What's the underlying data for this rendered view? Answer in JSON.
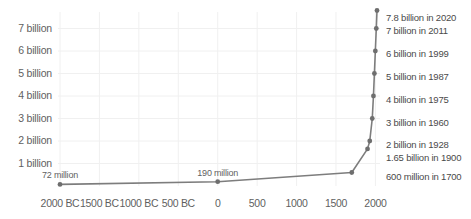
{
  "chart_data": {
    "type": "line",
    "title": "",
    "subtitle": "",
    "xlabel": "",
    "ylabel": "",
    "xlim": [
      -2000,
      2020
    ],
    "ylim": [
      0,
      7800000000
    ],
    "grid": true,
    "legend_position": "none",
    "x_ticks": [
      {
        "value": -2000,
        "label": "2000 BC"
      },
      {
        "value": -1500,
        "label": "1500 BC"
      },
      {
        "value": -1000,
        "label": "1000 BC"
      },
      {
        "value": -500,
        "label": "500 BC"
      },
      {
        "value": 0,
        "label": "0"
      },
      {
        "value": 500,
        "label": "500"
      },
      {
        "value": 1000,
        "label": "1000"
      },
      {
        "value": 1500,
        "label": "1500"
      },
      {
        "value": 2000,
        "label": "2000"
      }
    ],
    "y_ticks": [
      {
        "value": 1000000000,
        "label": "1 billion"
      },
      {
        "value": 2000000000,
        "label": "2 billion"
      },
      {
        "value": 3000000000,
        "label": "3 billion"
      },
      {
        "value": 4000000000,
        "label": "4 billion"
      },
      {
        "value": 5000000000,
        "label": "5 billion"
      },
      {
        "value": 6000000000,
        "label": "6 billion"
      },
      {
        "value": 7000000000,
        "label": "7 billion"
      }
    ],
    "series": [
      {
        "name": "World population",
        "color": "#7d7d7d",
        "x": [
          -2000,
          0,
          1700,
          1900,
          1928,
          1960,
          1975,
          1987,
          1999,
          2011,
          2020
        ],
        "y": [
          72000000,
          190000000,
          600000000,
          1650000000,
          2000000000,
          3000000000,
          4000000000,
          5000000000,
          6000000000,
          7000000000,
          7800000000
        ]
      }
    ],
    "annotations": [
      {
        "text": "72 million",
        "x": -2000,
        "y": 72000000,
        "placement": "above"
      },
      {
        "text": "190 million",
        "x": 0,
        "y": 190000000,
        "placement": "above"
      },
      {
        "text": "600 million in 1700",
        "x": 1700,
        "y": 600000000,
        "placement": "right"
      },
      {
        "text": "1.65 billion in 1900",
        "x": 1900,
        "y": 1650000000,
        "placement": "right"
      },
      {
        "text": "2 billion in 1928",
        "x": 1928,
        "y": 2000000000,
        "placement": "right"
      },
      {
        "text": "3 billion in 1960",
        "x": 1960,
        "y": 3000000000,
        "placement": "right"
      },
      {
        "text": "4 billion in 1975",
        "x": 1975,
        "y": 4000000000,
        "placement": "right"
      },
      {
        "text": "5 billion in 1987",
        "x": 1987,
        "y": 5000000000,
        "placement": "right"
      },
      {
        "text": "6 billion in 1999",
        "x": 1999,
        "y": 6000000000,
        "placement": "right"
      },
      {
        "text": "7 billion in 2011",
        "x": 2011,
        "y": 7000000000,
        "placement": "right"
      },
      {
        "text": "7.8 billion in 2020",
        "x": 2020,
        "y": 7800000000,
        "placement": "right"
      }
    ],
    "colors": {
      "line": "#7d7d7d",
      "marker": "#6e6e6e",
      "grid": "#f0f0f0",
      "tick_text": "#5f5f5f",
      "annotation_text": "#4a4a4a",
      "background": "#ffffff"
    }
  }
}
